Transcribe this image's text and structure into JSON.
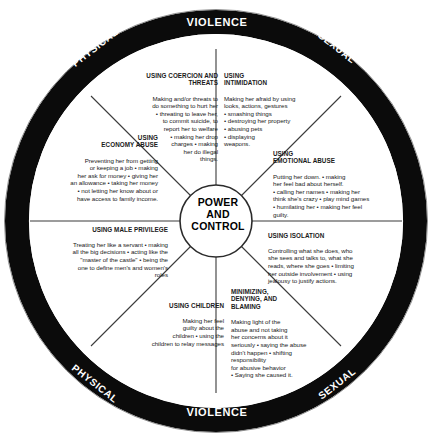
{
  "diagram": {
    "hub": {
      "line1": "POWER",
      "line2": "AND",
      "line3": "CONTROL",
      "full_label": "POWER AND CONTROL"
    },
    "ring": {
      "top_left": "PHYSICAL",
      "top_center": "VIOLENCE",
      "top_right": "SEXUAL",
      "bottom_left": "PHYSICAL",
      "bottom_center": "VIOLENCE",
      "bottom_right": "SEXUAL"
    },
    "colors": {
      "ring_fill": "#0b0b0b",
      "ring_text": "#ffffff",
      "segment_fill": "#ffffff",
      "line": "#2b2b2b",
      "body_text": "#1a1a1a"
    },
    "segments": [
      {
        "id": "coercion",
        "title": "USING COERCION AND\nTHREATS",
        "body": "Making and/or threats to\ndo something to hurt her\n• threating to leave her,\nto commit suicide, to\nreport her to welfare\n• making her drop\ncharges • making\nher do illegal\nthings.",
        "align": "right"
      },
      {
        "id": "intimidation",
        "title": "USING\nINTIMIDATION",
        "body": "Making her afraid by using\nlooks, actions, gestures\n• smashing things\n• destroying her property\n• abusing pets\n• displaying\nweapons.",
        "align": "left"
      },
      {
        "id": "economy",
        "title": "USING\nECONOMY ABUSE",
        "body": "Preventing her from getting\nor keeping a job • making\nher ask for money • giving her\nan allowance • taking her money\n• not letting her know about or\nhave access to family income.",
        "align": "right"
      },
      {
        "id": "emotional",
        "title": "USING\nEMOTIONAL ABUSE",
        "body": "Putting her down. • making\nher feel bad about herself.\n• calling her names • making her\nthink she's crazy • play mind games\n• humilating her • making her feel\nguilty.",
        "align": "left"
      },
      {
        "id": "male-privilege",
        "title": "USING MALE PRIVILEGE",
        "body": "Treating her like a servant • making\nall the big decisions  • acting like the\n\"master of the castle\" • being the\none to define men's and women's\nroles",
        "align": "right"
      },
      {
        "id": "isolation",
        "title": "USING ISOLATION",
        "body": "Controlling what she does, who\nshe sees and talks to, what she\nreads, where she goes • limiting\nher outside involvement • using\njealousy to justify actions.",
        "align": "left"
      },
      {
        "id": "children",
        "title": "USING CHILDREN",
        "body": "Making her feel\nguilty about the\nchildren • using the\nchildren to relay messages",
        "align": "right"
      },
      {
        "id": "minimizing",
        "title": "MINIMIZING,\nDENYING, AND\nBLAMING",
        "body": "Making light of the\nabuse and not taking\nher concerns about it\nseriously • saying the abuse\ndidn't happen • shifting responsibility\nfor abusive behavior\n• Saying she caused it.",
        "align": "left"
      }
    ]
  }
}
